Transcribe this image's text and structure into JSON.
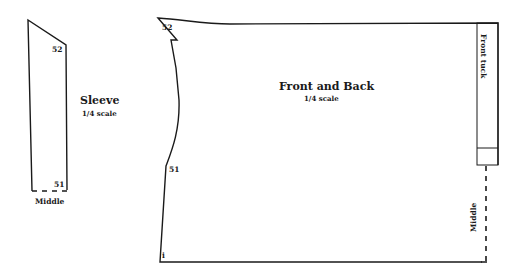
{
  "sleeve": {
    "title": "Sleeve",
    "scale": "1/4 scale",
    "marker_top": "52",
    "marker_bottom": "51",
    "fold_label": "Middle"
  },
  "front_back": {
    "title": "Front and Back",
    "scale": "1/4 scale",
    "marker_top": "52",
    "marker_side": "51",
    "marker_corner": "i",
    "tuck_label": "Front tuck",
    "fold_label": "Middle"
  },
  "colors": {
    "line": "#1a1a1a",
    "background": "#ffffff"
  }
}
